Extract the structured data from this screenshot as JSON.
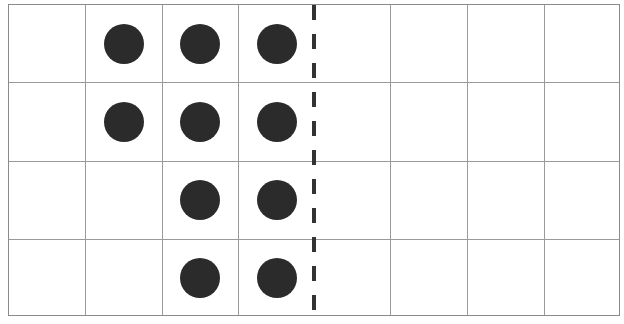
{
  "figure": {
    "type": "ten-frame-style dot grid",
    "rows": 4,
    "columns": 8,
    "dot_color": "#2b2b2b",
    "grid_line_color": "#9a9a9a",
    "divider": {
      "style": "dashed",
      "after_column": 4,
      "color": "#333333"
    },
    "dots": [
      {
        "row": 1,
        "col": 2
      },
      {
        "row": 1,
        "col": 3
      },
      {
        "row": 1,
        "col": 4
      },
      {
        "row": 2,
        "col": 2
      },
      {
        "row": 2,
        "col": 3
      },
      {
        "row": 2,
        "col": 4
      },
      {
        "row": 3,
        "col": 3
      },
      {
        "row": 3,
        "col": 4
      },
      {
        "row": 4,
        "col": 3
      },
      {
        "row": 4,
        "col": 4
      }
    ],
    "dot_count": 10
  }
}
